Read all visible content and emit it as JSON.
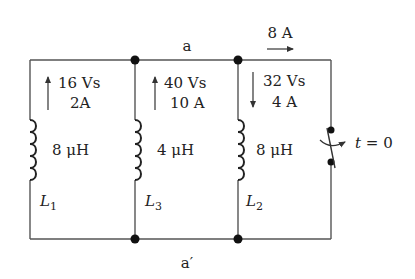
{
  "diagram": {
    "type": "circuit",
    "nodes": {
      "top": "a",
      "bottom": "a′"
    },
    "branches": [
      {
        "name": "L1",
        "label_main": "L",
        "label_sub": "1",
        "inductance": "8 μH",
        "flux_linkage": "16 Vs",
        "current": "2A",
        "current_direction": "up"
      },
      {
        "name": "L3",
        "label_main": "L",
        "label_sub": "3",
        "inductance": "4 μH",
        "flux_linkage": "40 Vs",
        "current": "10 A",
        "current_direction": "up"
      },
      {
        "name": "L2",
        "label_main": "L",
        "label_sub": "2",
        "inductance": "8 μH",
        "flux_linkage": "32 Vs",
        "current": "4 A",
        "current_direction": "down"
      }
    ],
    "switch": {
      "label": "t = 0",
      "label_t": "t",
      "label_eq": " = 0",
      "action": "opens"
    },
    "top_current": {
      "value": "8 A",
      "direction": "right"
    },
    "colors": {
      "wire": "#555555",
      "node": "#111111",
      "text": "#222222"
    }
  }
}
